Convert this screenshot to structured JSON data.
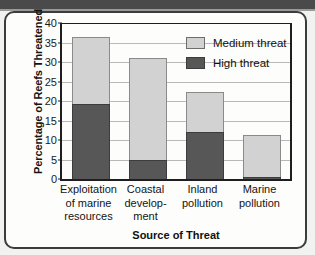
{
  "chart_data": {
    "type": "bar",
    "subtype": "stacked-bar",
    "title": "",
    "xlabel": "Source of Threat",
    "ylabel": "Percentage of Reefs Threatened",
    "ylim": [
      0,
      40
    ],
    "ytick_step": 5,
    "yticks": [
      40,
      35,
      30,
      25,
      20,
      15,
      10,
      5,
      0
    ],
    "grid": true,
    "legend_position": "upper-right-inside",
    "categories": [
      "Exploitation of marine resources",
      "Coastal development",
      "Inland pollution",
      "Marine pollution"
    ],
    "category_lines": [
      [
        "Exploitation",
        "of marine",
        "resources"
      ],
      [
        "Coastal",
        "develop-",
        "ment"
      ],
      [
        "Inland",
        "pollution"
      ],
      [
        "Marine",
        "pollution"
      ]
    ],
    "series": [
      {
        "name": "High threat",
        "color": "#575757",
        "values": [
          19.2,
          5.0,
          12.0,
          0.6
        ]
      },
      {
        "name": "Medium threat",
        "color": "#d2d2d2",
        "values": [
          17.3,
          26.1,
          10.2,
          10.6
        ]
      }
    ],
    "totals": [
      36.5,
      31.1,
      22.2,
      11.2
    ]
  },
  "legend": {
    "items": [
      {
        "label": "Medium threat",
        "swatch": "medium"
      },
      {
        "label": "High threat",
        "swatch": "high"
      }
    ]
  },
  "axes": {
    "y_title": "Percentage of Reefs Threatened",
    "x_title": "Source of Threat"
  },
  "colors": {
    "medium_threat": "#d2d2d2",
    "high_threat": "#575757",
    "axis": "#1e1e1e",
    "gridline": "#b9b9b9",
    "card_border": "#3c3c3c",
    "page_background": "#f2f2f0"
  }
}
